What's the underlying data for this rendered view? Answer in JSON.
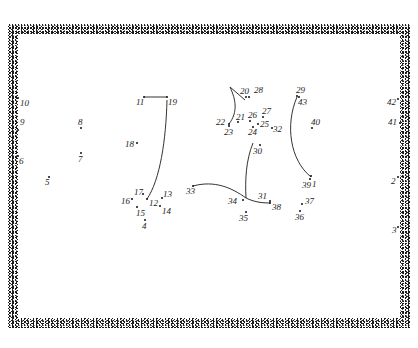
{
  "puzzle": {
    "type": "connect-the-dots",
    "border_color": "#1a1a1a",
    "line_color": "#333333",
    "dots": [
      {
        "n": "1",
        "dot": [
          311,
          176
        ],
        "label": [
          312,
          180
        ]
      },
      {
        "n": "2",
        "dot": [
          398,
          177
        ],
        "label": [
          391,
          177
        ]
      },
      {
        "n": "3",
        "dot": [
          398,
          227
        ],
        "label": [
          392,
          226
        ]
      },
      {
        "n": "4",
        "dot": [
          145,
          220
        ],
        "label": [
          142,
          222
        ]
      },
      {
        "n": "5",
        "dot": [
          49,
          177
        ],
        "label": [
          45,
          178
        ]
      },
      {
        "n": "6",
        "dot": [
          18,
          156
        ],
        "label": [
          19,
          157
        ]
      },
      {
        "n": "7",
        "dot": [
          81,
          153
        ],
        "label": [
          78,
          155
        ]
      },
      {
        "n": "8",
        "dot": [
          81,
          128
        ],
        "label": [
          78,
          118
        ]
      },
      {
        "n": "9",
        "dot": [
          18,
          130
        ],
        "label": [
          20,
          118
        ]
      },
      {
        "n": "10",
        "dot": [
          18,
          98
        ],
        "label": [
          20,
          99
        ]
      },
      {
        "n": "11",
        "dot": [
          144,
          97
        ],
        "label": [
          136,
          98
        ]
      },
      {
        "n": "12",
        "dot": [
          147,
          199
        ],
        "label": [
          149,
          199
        ]
      },
      {
        "n": "13",
        "dot": [
          162,
          198
        ],
        "label": [
          163,
          190
        ]
      },
      {
        "n": "14",
        "dot": [
          160,
          206
        ],
        "label": [
          162,
          207
        ]
      },
      {
        "n": "15",
        "dot": [
          137,
          207
        ],
        "label": [
          136,
          209
        ]
      },
      {
        "n": "16",
        "dot": [
          132,
          199
        ],
        "label": [
          121,
          197
        ]
      },
      {
        "n": "17",
        "dot": [
          143,
          194
        ],
        "label": [
          134,
          188
        ]
      },
      {
        "n": "18",
        "dot": [
          137,
          143
        ],
        "label": [
          125,
          140
        ]
      },
      {
        "n": "19",
        "dot": [
          167,
          97
        ],
        "label": [
          168,
          98
        ]
      },
      {
        "n": "20",
        "dot": [
          246,
          97
        ],
        "label": [
          240,
          87
        ]
      },
      {
        "n": "21",
        "dot": [
          238,
          122
        ],
        "label": [
          236,
          113
        ]
      },
      {
        "n": "22",
        "dot": [
          229,
          124
        ],
        "label": [
          216,
          118
        ]
      },
      {
        "n": "23",
        "dot": [
          229,
          126
        ],
        "label": [
          224,
          128
        ]
      },
      {
        "n": "24",
        "dot": [
          253,
          127
        ],
        "label": [
          248,
          128
        ]
      },
      {
        "n": "25",
        "dot": [
          258,
          124
        ],
        "label": [
          260,
          120
        ]
      },
      {
        "n": "26",
        "dot": [
          250,
          121
        ],
        "label": [
          248,
          111
        ]
      },
      {
        "n": "27",
        "dot": [
          263,
          117
        ],
        "label": [
          262,
          107
        ]
      },
      {
        "n": "28",
        "dot": [
          249,
          97
        ],
        "label": [
          254,
          86
        ]
      },
      {
        "n": "29",
        "dot": [
          297,
          96
        ],
        "label": [
          296,
          86
        ]
      },
      {
        "n": "30",
        "dot": [
          260,
          145
        ],
        "label": [
          253,
          147
        ]
      },
      {
        "n": "31",
        "dot": [
          270,
          201
        ],
        "label": [
          258,
          192
        ]
      },
      {
        "n": "32",
        "dot": [
          272,
          128
        ],
        "label": [
          273,
          125
        ]
      },
      {
        "n": "33",
        "dot": [
          193,
          186
        ],
        "label": [
          186,
          187
        ]
      },
      {
        "n": "34",
        "dot": [
          243,
          200
        ],
        "label": [
          228,
          197
        ]
      },
      {
        "n": "35",
        "dot": [
          246,
          212
        ],
        "label": [
          239,
          214
        ]
      },
      {
        "n": "36",
        "dot": [
          300,
          211
        ],
        "label": [
          295,
          213
        ]
      },
      {
        "n": "37",
        "dot": [
          302,
          204
        ],
        "label": [
          305,
          197
        ]
      },
      {
        "n": "38",
        "dot": [
          270,
          203
        ],
        "label": [
          272,
          203
        ]
      },
      {
        "n": "39",
        "dot": [
          310,
          179
        ],
        "label": [
          302,
          181
        ]
      },
      {
        "n": "40",
        "dot": [
          312,
          128
        ],
        "label": [
          311,
          118
        ]
      },
      {
        "n": "41",
        "dot": [
          400,
          123
        ],
        "label": [
          388,
          118
        ]
      },
      {
        "n": "42",
        "dot": [
          398,
          99
        ],
        "label": [
          387,
          98
        ]
      },
      {
        "n": "43",
        "dot": [
          299,
          97
        ],
        "label": [
          298,
          98
        ]
      }
    ],
    "drawn_lines": [
      {
        "name": "line-11-19",
        "d": "M144 97 L167 97"
      },
      {
        "name": "curve-19-12",
        "d": "M167 100 C166 140 160 180 147 199"
      },
      {
        "name": "line-hook-20",
        "d": "M230 87 L245 100"
      },
      {
        "name": "curve-hook-22",
        "d": "M230 87 C236 100 238 112 229 124"
      },
      {
        "name": "curve-30-34",
        "d": "M253 143 C246 160 245 180 246 198"
      },
      {
        "name": "curve-33-38",
        "d": "M193 186 C215 180 232 188 246 198 C254 202 262 203 270 203"
      },
      {
        "name": "curve-29-1",
        "d": "M297 97 C285 125 290 160 311 177"
      }
    ]
  }
}
